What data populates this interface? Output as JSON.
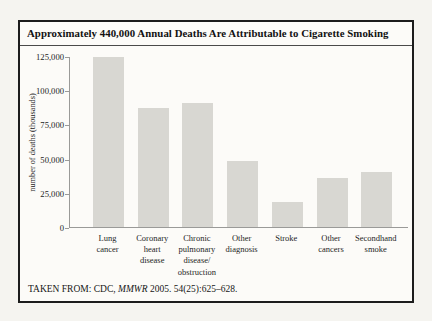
{
  "figure": {
    "title": "Approximately 440,000 Annual Deaths Are Attributable to Cigarette Smoking",
    "source_prefix": "TAKEN FROM: CDC, ",
    "source_journal": "MMWR",
    "source_suffix": " 2005. 54(25):625–628."
  },
  "chart_data": {
    "type": "bar",
    "title": "Approximately 440,000 Annual Deaths Are Attributable to Cigarette Smoking",
    "categories": [
      "Lung cancer",
      "Coronary heart disease",
      "Chronic pulmonary disease/obstruction",
      "Other diagnosis",
      "Stroke",
      "Other cancers",
      "Secondhand smoke"
    ],
    "category_lines": [
      [
        "Lung",
        "cancer"
      ],
      [
        "Coronary",
        "heart",
        "disease"
      ],
      [
        "Chronic",
        "pulmonary",
        "disease/",
        "obstruction"
      ],
      [
        "Other",
        "diagnosis"
      ],
      [
        "Stroke"
      ],
      [
        "Other",
        "cancers"
      ],
      [
        "Secondhand",
        "smoke"
      ]
    ],
    "values": [
      124000,
      87000,
      91000,
      48000,
      18000,
      36000,
      40000
    ],
    "xlabel": "",
    "ylabel": "number of deaths (thousands)",
    "ylim": [
      0,
      125000
    ],
    "yticks": [
      0,
      25000,
      50000,
      75000,
      100000,
      125000
    ],
    "ytick_labels": [
      "0",
      "25,000",
      "50,000",
      "75,000",
      "100,000",
      "125,000"
    ],
    "grid": false,
    "legend": null,
    "bar_color": "#d8d7d2",
    "axis_color": "#9a9a98"
  }
}
